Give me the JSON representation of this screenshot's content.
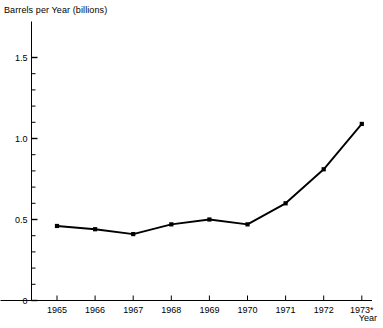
{
  "chart_data": {
    "type": "line",
    "title": "Barrels per Year (billions)",
    "xlabel": "Year",
    "ylabel": "Barrels per Year (billions)",
    "categories": [
      "1965",
      "1966",
      "1967",
      "1968",
      "1969",
      "1970",
      "1971",
      "1972",
      "1973*"
    ],
    "x": [
      1965,
      1966,
      1967,
      1968,
      1969,
      1970,
      1971,
      1972,
      1973
    ],
    "values": [
      0.46,
      0.44,
      0.41,
      0.47,
      0.5,
      0.47,
      0.6,
      0.81,
      1.09
    ],
    "series": [
      {
        "name": "Barrels per Year",
        "values": [
          0.46,
          0.44,
          0.41,
          0.47,
          0.5,
          0.47,
          0.6,
          0.81,
          1.09
        ]
      }
    ],
    "ylim": [
      0,
      1.6
    ],
    "xlim": [
      1964.6,
      1973.4
    ],
    "ytick_labels": [
      "0",
      "0.5",
      "1.0",
      "1.5"
    ],
    "ytick_values": [
      0,
      0.5,
      1.0,
      1.5
    ],
    "yminor_step": 0.1,
    "grid": false,
    "legend": false,
    "marker": "square",
    "line_color": "#000000",
    "marker_color": "#000000",
    "axis_color": "#000000",
    "background": "#ffffff",
    "footnote_marker": "*"
  },
  "axes": {
    "y_title": "Barrels per Year (billions)",
    "x_title": "Year"
  }
}
